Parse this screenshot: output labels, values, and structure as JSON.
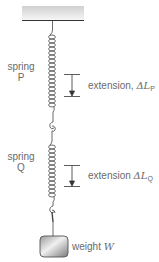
{
  "diagram": {
    "type": "springs-in-series",
    "ceiling": {
      "label": ""
    },
    "springs": [
      {
        "id": "P",
        "label_line1": "spring",
        "label_line2": "P",
        "extension_label": "extension, ",
        "extension_symbol": "ΔL",
        "extension_subscript": "P"
      },
      {
        "id": "Q",
        "label_line1": "spring",
        "label_line2": "Q",
        "extension_label": "extension ",
        "extension_symbol": "ΔL",
        "extension_subscript": "Q"
      }
    ],
    "weight": {
      "label": "weight ",
      "symbol": "W"
    },
    "colors": {
      "line": "#333333",
      "ceiling_top": "#cfcfcf",
      "ceiling_bottom": "#f4f4f4",
      "weight_dark": "#8a8a8a",
      "weight_light": "#e6e6e6"
    }
  }
}
